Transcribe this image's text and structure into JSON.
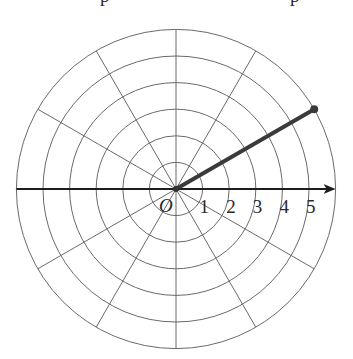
{
  "diagram": {
    "center": {
      "x": 176,
      "y": 189
    },
    "ring_spacing_px": 26.6,
    "ring_count": 6,
    "spoke_angle_step_deg": 30,
    "origin_label": "O",
    "axis_labels": [
      "1",
      "2",
      "3",
      "4",
      "5"
    ],
    "top_fragments": [
      "p",
      "p"
    ],
    "polar_point": {
      "r": 6,
      "theta_deg": 30,
      "description": "segment from pole to point on outer ring"
    },
    "colors": {
      "grid": "#6a6a6a",
      "axis": "#1e1e1e",
      "ray": "#3a3a3a",
      "background": "#ffffff"
    }
  }
}
